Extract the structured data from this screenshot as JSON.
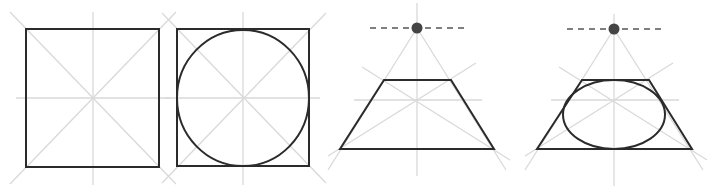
{
  "diagram": {
    "title": "",
    "colors": {
      "background": "#ffffff",
      "shape_stroke": "#2b2b2b",
      "guide_stroke": "#d9d9d9",
      "vanishing_point": "#444444",
      "horizon_dash": "#555555"
    },
    "figures": [
      {
        "id": "square",
        "label": "",
        "square": {
          "x": 26,
          "y": 29,
          "w": 133,
          "h": 138
        },
        "center": [
          93,
          98
        ]
      },
      {
        "id": "circle-in-square",
        "label": "",
        "square": {
          "x": 177,
          "y": 29,
          "w": 132,
          "h": 137
        },
        "circle": {
          "cx": 243,
          "cy": 98,
          "rx": 66,
          "ry": 68
        }
      },
      {
        "id": "perspective-square",
        "label": "",
        "vanishing_point": [
          417,
          28
        ],
        "horizon_line": {
          "x1": 370,
          "x2": 465,
          "y": 28
        },
        "trapezoid": {
          "top_y": 80,
          "top_x1": 384,
          "top_x2": 451,
          "bottom_y": 149,
          "bottom_x1": 340,
          "bottom_x2": 494
        }
      },
      {
        "id": "perspective-circle",
        "label": "",
        "vanishing_point": [
          614,
          29
        ],
        "horizon_line": {
          "x1": 567,
          "x2": 662,
          "y": 29
        },
        "trapezoid": {
          "top_y": 80,
          "top_x1": 582,
          "top_x2": 649,
          "bottom_y": 149,
          "bottom_x1": 537,
          "bottom_x2": 692
        },
        "ellipse": {
          "cx": 614,
          "cy": 114.5,
          "rx": 51,
          "ry": 34.5
        }
      }
    ]
  }
}
